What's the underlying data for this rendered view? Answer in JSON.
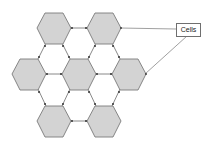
{
  "diagram": {
    "label": "Cells",
    "colors": {
      "cell_fill": "#d3d3d3",
      "cell_stroke": "#7a7a7a",
      "link": "#6a6a6a",
      "node": "#333333",
      "callout_line": "#777777"
    },
    "cells": [
      {
        "id": "cell-top-left",
        "cx": 54,
        "cy": 28
      },
      {
        "id": "cell-top-right",
        "cx": 104,
        "cy": 28
      },
      {
        "id": "cell-mid-left",
        "cx": 29,
        "cy": 74
      },
      {
        "id": "cell-mid-center",
        "cx": 79,
        "cy": 74
      },
      {
        "id": "cell-mid-right",
        "cx": 129,
        "cy": 74
      },
      {
        "id": "cell-bottom-left",
        "cx": 54,
        "cy": 121
      },
      {
        "id": "cell-bottom-right",
        "cx": 104,
        "cy": 121
      }
    ],
    "callouts": [
      {
        "from": "cell-top-right"
      },
      {
        "from": "cell-mid-right"
      }
    ]
  }
}
